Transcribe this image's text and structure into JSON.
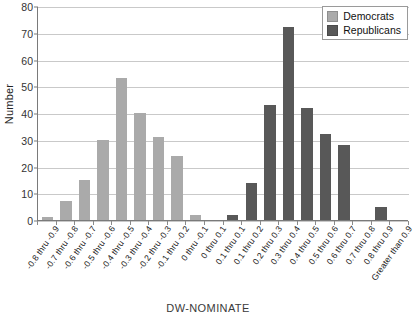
{
  "chart_data": {
    "type": "bar",
    "title": "",
    "xlabel": "DW-NOMINATE",
    "ylabel": "Number",
    "ylim": [
      0,
      80
    ],
    "ytick_step": 10,
    "yticks": [
      0,
      10,
      20,
      30,
      40,
      50,
      60,
      70,
      80
    ],
    "grid": true,
    "legend_position": "top-right",
    "categories": [
      "-0.8 thru -0.9",
      "-0.7 thru -0.8",
      "-0.6 thru -0.7",
      "-0.5 thru -0.6",
      "-0.4 thru -0.5",
      "-0.3 thru -0.4",
      "-0.2 thru -0.3",
      "-0.1 thru -0.2",
      "0 thru -0.1",
      "0 thru 0.1",
      "0.1 thru 0.1",
      "0.1 thru 0.2",
      "0.2 thru 0.3",
      "0.3 thru 0.4",
      "0.4 thru 0.5",
      "0.5 thru 0.6",
      "0.6 thru 0.7",
      "0.7 thru 0.8",
      "0.8 thru 0.9",
      "Greater than 0.9"
    ],
    "series": [
      {
        "name": "Democrats",
        "color": "#aaaaaa",
        "values": [
          1,
          7,
          15,
          30,
          53,
          40,
          31,
          24,
          2,
          null,
          null,
          null,
          null,
          null,
          null,
          null,
          null,
          null,
          null,
          null
        ]
      },
      {
        "name": "Republicans",
        "color": "#585858",
        "values": [
          null,
          null,
          null,
          null,
          null,
          null,
          null,
          null,
          null,
          null,
          2,
          14,
          43,
          72,
          42,
          32,
          28,
          null,
          5,
          null
        ]
      }
    ],
    "bars": [
      {
        "category": "-0.8 thru -0.9",
        "value": 1,
        "party": "dem"
      },
      {
        "category": "-0.7 thru -0.8",
        "value": 7,
        "party": "dem"
      },
      {
        "category": "-0.6 thru -0.7",
        "value": 15,
        "party": "dem"
      },
      {
        "category": "-0.5 thru -0.6",
        "value": 30,
        "party": "dem"
      },
      {
        "category": "-0.4 thru -0.5",
        "value": 53,
        "party": "dem"
      },
      {
        "category": "-0.3 thru -0.4",
        "value": 40,
        "party": "dem"
      },
      {
        "category": "-0.2 thru -0.3",
        "value": 31,
        "party": "dem"
      },
      {
        "category": "-0.1 thru -0.2",
        "value": 24,
        "party": "dem"
      },
      {
        "category": "0 thru -0.1",
        "value": 2,
        "party": "dem"
      },
      {
        "category": "0 thru 0.1",
        "value": 0,
        "party": "rep"
      },
      {
        "category": "0.1 thru 0.1",
        "value": 2,
        "party": "rep"
      },
      {
        "category": "0.1 thru 0.2",
        "value": 14,
        "party": "rep"
      },
      {
        "category": "0.2 thru 0.3",
        "value": 43,
        "party": "rep"
      },
      {
        "category": "0.3 thru 0.4",
        "value": 72,
        "party": "rep"
      },
      {
        "category": "0.4 thru 0.5",
        "value": 42,
        "party": "rep"
      },
      {
        "category": "0.5 thru 0.6",
        "value": 32,
        "party": "rep"
      },
      {
        "category": "0.6 thru 0.7",
        "value": 28,
        "party": "rep"
      },
      {
        "category": "0.7 thru 0.8",
        "value": 0,
        "party": "rep"
      },
      {
        "category": "0.8 thru 0.9",
        "value": 5,
        "party": "rep"
      },
      {
        "category": "Greater than 0.9",
        "value": 0,
        "party": "rep"
      }
    ]
  },
  "legend": {
    "items": [
      {
        "label": "Democrats",
        "color": "#aaaaaa",
        "party": "dem"
      },
      {
        "label": "Republicans",
        "color": "#585858",
        "party": "rep"
      }
    ]
  }
}
